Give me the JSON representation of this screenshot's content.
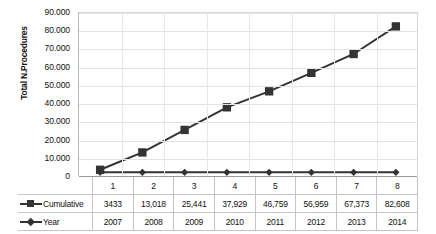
{
  "chart_data": {
    "type": "line",
    "title": "",
    "xlabel": "",
    "ylabel": "Total N.Procedures",
    "categories": [
      "1",
      "2",
      "3",
      "4",
      "5",
      "6",
      "7",
      "8"
    ],
    "ylim": [
      0,
      90000
    ],
    "yticks": [
      0,
      10000,
      20000,
      30000,
      40000,
      50000,
      60000,
      70000,
      80000,
      90000
    ],
    "ytick_labels": [
      "0",
      "10.000",
      "20.000",
      "30.000",
      "40.000",
      "50.000",
      "60.000",
      "70.000",
      "80.000",
      "90.000"
    ],
    "grid": true,
    "legend_position": "data-table-left",
    "series": [
      {
        "name": "Cumulative",
        "marker": "square",
        "color": "#333333",
        "values": [
          3433,
          13018,
          25441,
          37929,
          46759,
          56959,
          67373,
          82608
        ],
        "labels": [
          "3433",
          "13,018",
          "25,441",
          "37,929",
          "46,759",
          "56,959",
          "67,373",
          "82,608"
        ]
      },
      {
        "name": "Year",
        "marker": "diamond",
        "color": "#333333",
        "values": [
          2007,
          2008,
          2009,
          2010,
          2011,
          2012,
          2013,
          2014
        ],
        "labels": [
          "2007",
          "2008",
          "2009",
          "2010",
          "2011",
          "2012",
          "2013",
          "2014"
        ]
      }
    ]
  },
  "axis": {
    "ylabel": "Total N.Procedures"
  },
  "table": {
    "rows": [
      {
        "name": "Cumulative",
        "marker": "square"
      },
      {
        "name": "Year",
        "marker": "diamond"
      }
    ]
  }
}
